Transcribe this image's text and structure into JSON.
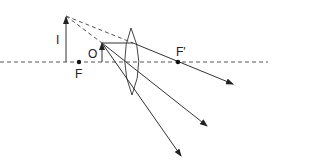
{
  "diagram": {
    "labels": {
      "image": "I",
      "object": "O",
      "focus_left": "F",
      "focus_right": "F'"
    },
    "colors": {
      "line": "#333333",
      "background": "#ffffff"
    }
  }
}
